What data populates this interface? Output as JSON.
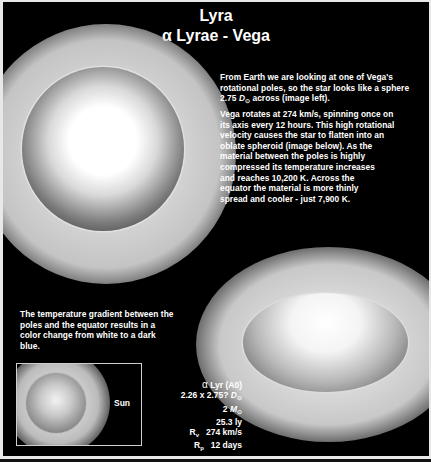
{
  "header": {
    "title": "Lyra",
    "subtitle_symbol": "α",
    "subtitle_text": "Lyrae - Vega"
  },
  "paragraph1": {
    "line1": "From Earth we are looking at one of Vega's",
    "line2": "rotational poles, so the star looks like a sphere",
    "line3_pre": "2.75 ",
    "line3_unit": "D",
    "line3_unit_sub": "⊙",
    "line3_post": " across (image left)."
  },
  "paragraph2": {
    "lines": [
      "Vega rotates at 274 km/s, spinning once on",
      "its axis every 12 hours. This high rotational",
      "velocity causes the star to flatten into an",
      "oblate spheroid  (image below). As the",
      "material between the poles is highly",
      "compressed its temperature increases",
      "and reaches 10,200 K. Across the",
      "equator the material is more thinly",
      "spread and cooler - just 7,900 K."
    ]
  },
  "paragraph3": {
    "lines": [
      "The temperature gradient between the",
      "poles and the equator results in a",
      "color change from white to a dark",
      "blue."
    ]
  },
  "images": {
    "pole_view": "vega-pole-view-sphere",
    "equator_view": "vega-oblate-spheroid",
    "comparison": "sun-comparison"
  },
  "comparison": {
    "sun_label": "Sun"
  },
  "facts": {
    "name_symbol": "α",
    "name_text": "Lyr (A0)",
    "diameter_value": "2.26 x 2.75? ",
    "diameter_unit": "D",
    "diameter_sub": "⊙",
    "mass_value": "2 ",
    "mass_unit": "M",
    "mass_sub": "⊙",
    "distance": "25.3 ly",
    "rot_velocity_label": "R",
    "rot_velocity_sub": "v",
    "rot_velocity_value": "274 km/s",
    "rot_period_label": "R",
    "rot_period_sub": "p",
    "rot_period_value": "12 days"
  }
}
